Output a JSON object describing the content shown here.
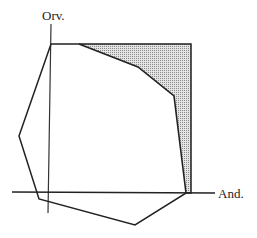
{
  "diagram": {
    "axes": {
      "y_label": "Orv.",
      "x_label": "And."
    },
    "colors": {
      "line": "#222222",
      "shade": "#b8b8b8",
      "background": "#ffffff"
    },
    "shapes": {
      "outer_polygon": "hexagon-like region",
      "shaded_region": "area between top-right corner and inner curve"
    }
  }
}
